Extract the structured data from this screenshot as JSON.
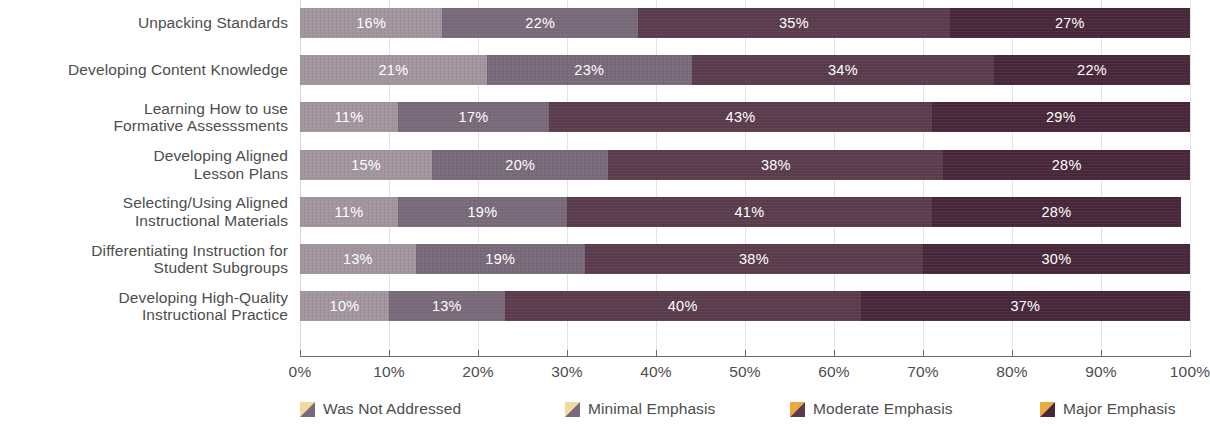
{
  "chart_data": {
    "type": "bar",
    "orientation": "horizontal",
    "stacked": true,
    "stacked_percent": true,
    "title": "",
    "subtitle": "",
    "xlabel": "",
    "ylabel": "",
    "xlim": [
      0,
      100
    ],
    "grid": true,
    "legend_position": "bottom",
    "xticks": [
      "0%",
      "10%",
      "20%",
      "30%",
      "40%",
      "50%",
      "60%",
      "70%",
      "80%",
      "90%",
      "100%"
    ],
    "xtick_values": [
      0,
      10,
      20,
      30,
      40,
      50,
      60,
      70,
      80,
      90,
      100
    ],
    "categories": [
      "Unpacking Standards",
      "Developing Content Knowledge",
      "Learning How to use\nFormative Assesssments",
      "Developing Aligned\nLesson Plans",
      "Selecting/Using Aligned\nInstructional Materials",
      "Differentiating Instruction for\nStudent Subgroups",
      "Developing High-Quality\nInstructional Practice"
    ],
    "category_lines": [
      [
        "Unpacking Standards"
      ],
      [
        "Developing Content Knowledge"
      ],
      [
        "Learning How to use",
        "Formative Assesssments"
      ],
      [
        "Developing Aligned",
        "Lesson Plans"
      ],
      [
        "Selecting/Using Aligned",
        "Instructional Materials"
      ],
      [
        "Differentiating Instruction for",
        "Student Subgroups"
      ],
      [
        "Developing High-Quality",
        "Instructional Practice"
      ]
    ],
    "series": [
      {
        "name": "Was Not Addressed",
        "color": "#a2959d",
        "values": [
          16,
          21,
          11,
          15,
          11,
          13,
          10
        ],
        "labels": [
          "16%",
          "21%",
          "11%",
          "15%",
          "11%",
          "13%",
          "10%"
        ]
      },
      {
        "name": "Minimal Emphasis",
        "color": "#786a79",
        "values": [
          22,
          23,
          17,
          20,
          19,
          19,
          13
        ],
        "labels": [
          "22%",
          "23%",
          "17%",
          "20%",
          "19%",
          "19%",
          "13%"
        ]
      },
      {
        "name": "Moderate Emphasis",
        "color": "#5b3c4d",
        "values": [
          35,
          34,
          43,
          38,
          41,
          38,
          40
        ],
        "labels": [
          "35%",
          "34%",
          "43%",
          "38%",
          "41%",
          "38%",
          "40%"
        ]
      },
      {
        "name": "Major Emphasis",
        "color": "#48273a",
        "values": [
          27,
          22,
          29,
          28,
          28,
          30,
          37
        ],
        "labels": [
          "27%",
          "22%",
          "29%",
          "28%",
          "28%",
          "30%",
          "37%"
        ]
      }
    ]
  },
  "legend": {
    "items": [
      {
        "label": "Was Not Addressed",
        "color": "#786a79",
        "accent": "#f2d9a0"
      },
      {
        "label": "Minimal Emphasis",
        "color": "#786a79",
        "accent": "#f2d9a0"
      },
      {
        "label": "Moderate Emphasis",
        "color": "#5b3c4d",
        "accent": "#f0a83c"
      },
      {
        "label": "Major Emphasis",
        "color": "#48273a",
        "accent": "#f0a83c"
      }
    ]
  },
  "style": {
    "gridline_color": "#e3e3e6",
    "axis_color": "#6d6d6d",
    "text_color": "#4d4d4d",
    "value_label_color": "#ffffff",
    "background": "#ffffff"
  }
}
